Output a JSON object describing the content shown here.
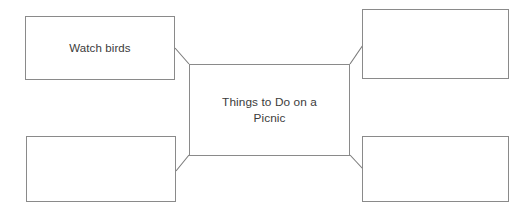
{
  "diagram": {
    "type": "concept-map",
    "title_node": {
      "id": "center",
      "text": "Things to Do on a\nPicnic"
    },
    "branch_nodes": [
      {
        "id": "top-left",
        "position": "top-left",
        "text": "Watch birds"
      },
      {
        "id": "top-right",
        "position": "top-right",
        "text": ""
      },
      {
        "id": "bottom-left",
        "position": "bottom-left",
        "text": ""
      },
      {
        "id": "bottom-right",
        "position": "bottom-right",
        "text": ""
      }
    ],
    "connectors": [
      {
        "from": "center",
        "to": "top-left"
      },
      {
        "from": "center",
        "to": "top-right"
      },
      {
        "from": "center",
        "to": "bottom-left"
      },
      {
        "from": "center",
        "to": "bottom-right"
      }
    ],
    "colors": {
      "border": "#8a8a8a",
      "connector": "#7a7a7a",
      "text": "#3b3b3b",
      "background": "#ffffff"
    }
  }
}
